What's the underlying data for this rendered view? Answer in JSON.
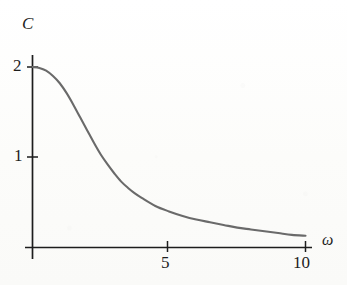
{
  "figure": {
    "background_color": "#fdfdfc",
    "axis_color": "#1d1d1d",
    "curve_color": "#6a6a6a",
    "label_color": "#1d1d1d"
  },
  "axes": {
    "y_axis_label": "C",
    "x_axis_label": "ω",
    "y_tick_labels": [
      "2",
      "1"
    ],
    "x_tick_labels": [
      "5",
      "10"
    ]
  },
  "chart_data": {
    "type": "line",
    "title": "",
    "subtitle": "",
    "xlabel": "ω",
    "ylabel": "C",
    "xlim": [
      0,
      10.6
    ],
    "ylim": [
      0,
      2.25
    ],
    "xticks": [
      5,
      10
    ],
    "yticks": [
      1,
      2
    ],
    "xtick_labels": [
      "5",
      "10"
    ],
    "ytick_labels": [
      "1",
      "2"
    ],
    "grid": false,
    "legend": null,
    "legend_position": "none",
    "annotations": [],
    "series": [
      {
        "name": "C(ω)",
        "color": "#6a6a6a",
        "line_width": 2.1,
        "x": [
          0.0,
          0.25,
          0.5,
          0.75,
          1.0,
          1.25,
          1.5,
          1.75,
          2.0,
          2.25,
          2.5,
          2.75,
          3.0,
          3.25,
          3.5,
          3.75,
          4.0,
          4.5,
          5.0,
          5.5,
          6.0,
          6.5,
          7.0,
          7.5,
          8.0,
          8.5,
          9.0,
          9.5,
          10.0
        ],
        "y": [
          2.0,
          1.99,
          1.96,
          1.9,
          1.82,
          1.71,
          1.58,
          1.44,
          1.3,
          1.16,
          1.03,
          0.92,
          0.82,
          0.73,
          0.66,
          0.6,
          0.55,
          0.46,
          0.4,
          0.35,
          0.31,
          0.28,
          0.25,
          0.22,
          0.2,
          0.18,
          0.16,
          0.14,
          0.13
        ]
      }
    ]
  }
}
